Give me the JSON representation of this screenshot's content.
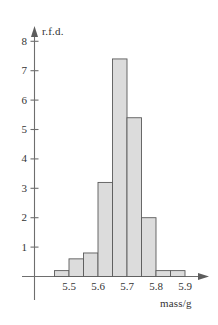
{
  "chart_data": {
    "type": "bar",
    "title": "",
    "subtitle": "",
    "xlabel": "mass/g",
    "ylabel": "r.f.d.",
    "grid": false,
    "legend": null,
    "bin_width": 0.05,
    "xlim": [
      5.4,
      5.95
    ],
    "ylim": [
      0,
      8.6
    ],
    "x_ticks": [
      "5.5",
      "5.6",
      "5.7",
      "5.8",
      "5.9"
    ],
    "x_tick_values": [
      5.5,
      5.6,
      5.7,
      5.8,
      5.9
    ],
    "y_ticks": [
      "1",
      "2",
      "3",
      "4",
      "5",
      "6",
      "7",
      "8"
    ],
    "y_tick_values": [
      1,
      2,
      3,
      4,
      5,
      6,
      7,
      8
    ],
    "bins": [
      {
        "start": 5.45,
        "end": 5.5,
        "value": 0.2
      },
      {
        "start": 5.5,
        "end": 5.55,
        "value": 0.6
      },
      {
        "start": 5.55,
        "end": 5.6,
        "value": 0.8
      },
      {
        "start": 5.6,
        "end": 5.65,
        "value": 3.2
      },
      {
        "start": 5.65,
        "end": 5.7,
        "value": 7.4
      },
      {
        "start": 5.7,
        "end": 5.75,
        "value": 5.4
      },
      {
        "start": 5.75,
        "end": 5.8,
        "value": 2.0
      },
      {
        "start": 5.8,
        "end": 5.85,
        "value": 0.2
      },
      {
        "start": 5.85,
        "end": 5.9,
        "value": 0.2
      }
    ],
    "categories": [
      "5.45-5.50",
      "5.50-5.55",
      "5.55-5.60",
      "5.60-5.65",
      "5.65-5.70",
      "5.70-5.75",
      "5.75-5.80",
      "5.80-5.85",
      "5.85-5.90"
    ],
    "values": [
      0.2,
      0.6,
      0.8,
      3.2,
      7.4,
      5.4,
      2.0,
      0.2,
      0.2
    ],
    "colors": {
      "bar_fill": "#dcdcdc",
      "bar_stroke": "#5a5a5a",
      "axis": "#6e6e6e",
      "text": "#333333",
      "background": "#ffffff"
    }
  }
}
